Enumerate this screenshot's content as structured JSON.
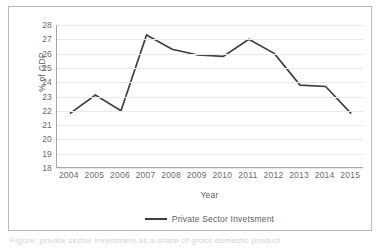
{
  "chart_data": {
    "type": "line",
    "title": "",
    "xlabel": "Year",
    "ylabel": "% of GDP",
    "categories": [
      "2004",
      "2005",
      "2006",
      "2007",
      "2008",
      "2009",
      "2010",
      "2011",
      "2012",
      "2013",
      "2014",
      "2015"
    ],
    "series": [
      {
        "name": "Private Sector Invetsment",
        "color": "#3f3f3f",
        "values": [
          21.8,
          23.1,
          22.0,
          27.3,
          26.3,
          25.9,
          25.8,
          27.0,
          26.0,
          23.8,
          23.7,
          21.8
        ]
      }
    ],
    "ylim": [
      18,
      28
    ],
    "ytick_step": 1,
    "yticks": [
      "28",
      "27",
      "26",
      "25",
      "24",
      "23",
      "22",
      "21",
      "20",
      "19",
      "18"
    ],
    "grid": "horizontal",
    "legend_position": "bottom"
  },
  "legend": {
    "entries": [
      {
        "label": "Private Sector Invetsment",
        "color": "#3f3f3f"
      }
    ]
  },
  "axes": {
    "y_title": "% of GDP",
    "x_title": "Year"
  },
  "caption": {
    "text": "Figure: private sector investment as a share of gross domestic product"
  }
}
